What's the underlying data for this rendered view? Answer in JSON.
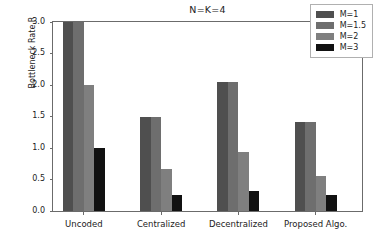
{
  "chart_data": {
    "type": "bar",
    "title": "N=K=4",
    "xlabel": "",
    "ylabel": "Bottleneck Rate,R",
    "categories": [
      "Uncoded",
      "Centralized",
      "Decentralized",
      "Proposed Algo."
    ],
    "series": [
      {
        "name": "M=1",
        "color": "#4f4f4f",
        "values": [
          3.0,
          1.5,
          2.05,
          1.41
        ]
      },
      {
        "name": "M=1.5",
        "color": "#6e6e6e",
        "values": [
          3.0,
          1.5,
          2.05,
          1.41
        ]
      },
      {
        "name": "M=2",
        "color": "#7f7f7f",
        "values": [
          2.0,
          0.67,
          0.93,
          0.55
        ]
      },
      {
        "name": "M=3",
        "color": "#111111",
        "values": [
          1.0,
          0.25,
          0.32,
          0.25
        ]
      }
    ],
    "ylim": [
      0.0,
      3.0
    ],
    "yticks": [
      "0.0",
      "0.5",
      "1.0",
      "1.5",
      "2.0",
      "2.5",
      "3.0"
    ],
    "ytick_values": [
      0.0,
      0.5,
      1.0,
      1.5,
      2.0,
      2.5,
      3.0
    ],
    "grid": false,
    "legend_position": "upper right",
    "axis_color": "#6b6b6b",
    "background": "#ffffff"
  },
  "legend": {
    "entries": [
      {
        "label": "M=1",
        "color": "#4f4f4f"
      },
      {
        "label": "M=1.5",
        "color": "#6e6e6e"
      },
      {
        "label": "M=2",
        "color": "#7f7f7f"
      },
      {
        "label": "M=3",
        "color": "#111111"
      }
    ]
  }
}
